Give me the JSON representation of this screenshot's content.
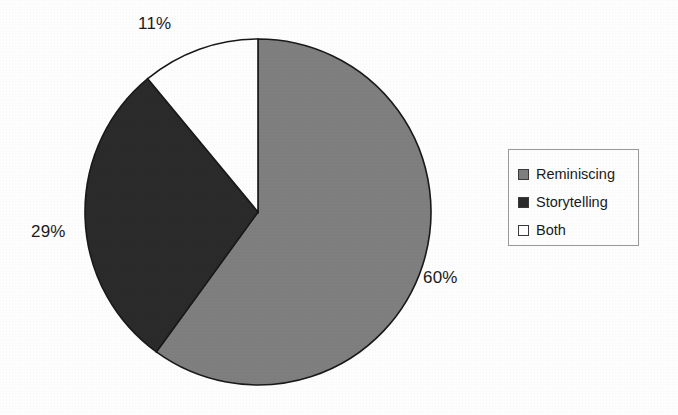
{
  "chart_data": {
    "type": "pie",
    "title": "",
    "subtitle": "",
    "xlabel": "",
    "ylabel": "",
    "categories": [
      "Reminiscing",
      "Storytelling",
      "Both"
    ],
    "values": [
      60,
      29,
      11
    ],
    "unit": "%",
    "data_labels": [
      "60%",
      "29%",
      "11%"
    ],
    "colors": [
      "#808080",
      "#2b2b2b",
      "#ffffff"
    ],
    "slice_border_color": "#1a1a1a",
    "start_angle_deg": 0,
    "direction": "clockwise",
    "grid": false,
    "legend_position": "right",
    "legend_entries": [
      {
        "label": "Reminiscing",
        "color": "#808080",
        "value": 60,
        "data_label": "60%"
      },
      {
        "label": "Storytelling",
        "color": "#2b2b2b",
        "value": 29,
        "data_label": "29%"
      },
      {
        "label": "Both",
        "color": "#ffffff",
        "value": 11,
        "data_label": "11%"
      }
    ]
  },
  "labels": {
    "both_pct": "11%",
    "storytelling_pct": "29%",
    "reminiscing_pct": "60%"
  },
  "legend": {
    "items": [
      {
        "label": "Reminiscing"
      },
      {
        "label": "Storytelling"
      },
      {
        "label": "Both"
      }
    ]
  },
  "style": {
    "background": "#ffffff",
    "text_color": "#1b1b1b",
    "legend_border": "#9a9a9a"
  }
}
